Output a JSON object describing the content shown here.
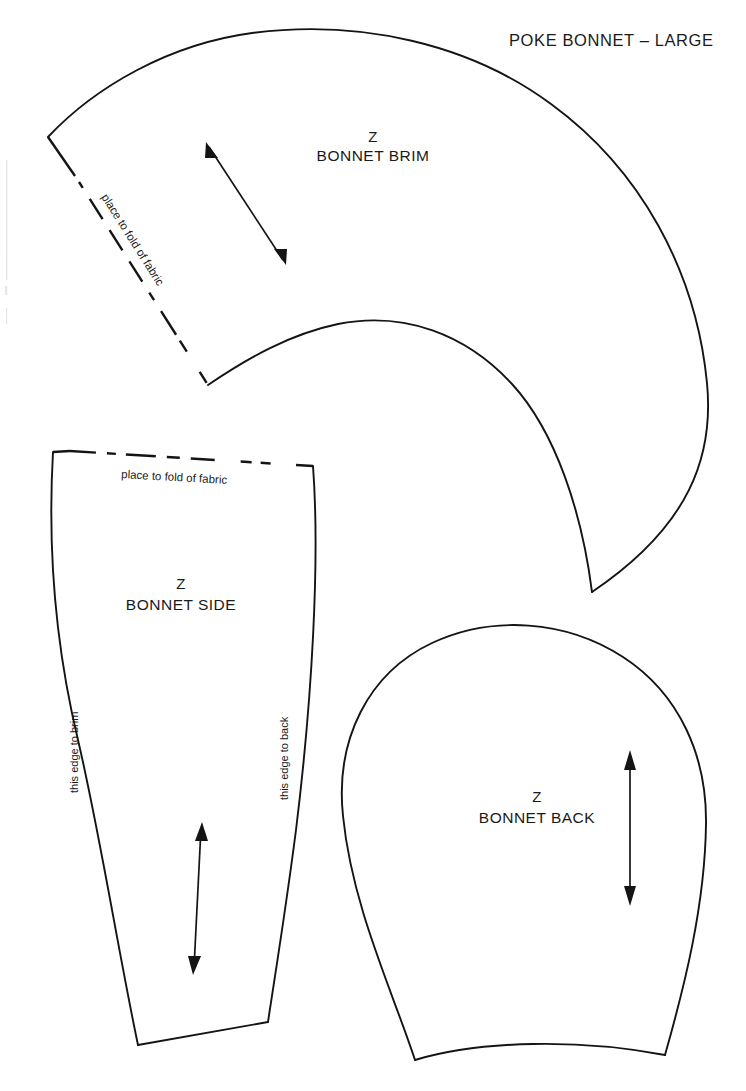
{
  "sheet": {
    "title": "POKE BONNET – LARGE",
    "background_color": "#ffffff",
    "ink_color": "#141414",
    "width": 746,
    "height": 1091
  },
  "pieces": {
    "brim": {
      "code": "Z",
      "name": "BONNET BRIM",
      "fold_label": "place to fold of fabric",
      "grainline": "double-headed-arrow"
    },
    "side": {
      "code": "Z",
      "name": "BONNET SIDE",
      "fold_label": "place to fold of fabric",
      "left_edge_label": "this edge to brim",
      "right_edge_label": "this edge to back",
      "grainline": "double-headed-arrow"
    },
    "back": {
      "code": "Z",
      "name": "BONNET BACK",
      "grainline": "double-headed-arrow"
    }
  }
}
